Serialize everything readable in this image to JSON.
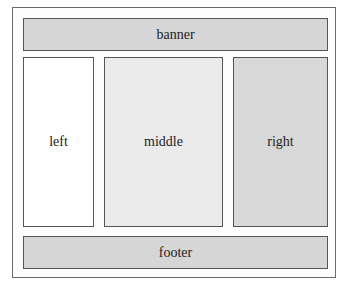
{
  "diagram": {
    "type": "page-layout",
    "regions": {
      "banner": {
        "label": "banner",
        "color": "#d6d6d6"
      },
      "left": {
        "label": "left",
        "color": "#ffffff"
      },
      "middle": {
        "label": "middle",
        "color": "#ebebeb"
      },
      "right": {
        "label": "right",
        "color": "#d8d8d8"
      },
      "footer": {
        "label": "footer",
        "color": "#d6d6d6"
      }
    }
  }
}
